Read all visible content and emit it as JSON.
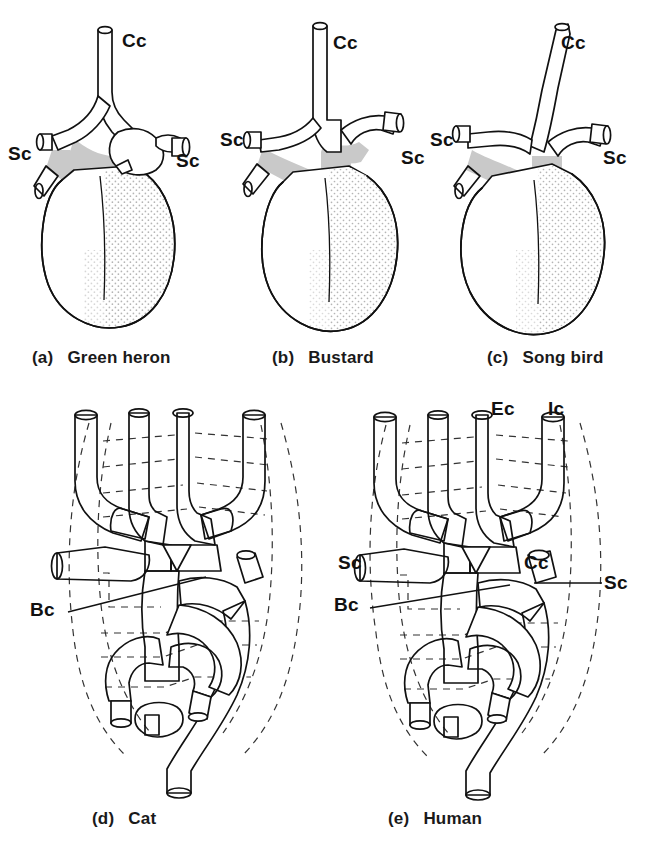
{
  "figure": {
    "background_color": "#ffffff",
    "ink_color": "#111111",
    "arch_shade_color": "#c9c9c9",
    "stipple_color": "#b9b9b9"
  },
  "panels": [
    {
      "id": "a",
      "caption_index": "(a)",
      "caption_name": "Green heron",
      "group": "birds",
      "labels": [
        {
          "text": "Cc",
          "name": "common-carotid-label",
          "x": 122,
          "y": 38
        },
        {
          "text": "Sc",
          "name": "subclavian-left-label",
          "x": 30,
          "y": 152
        },
        {
          "text": "Sc",
          "name": "subclavian-right-label",
          "x": 176,
          "y": 158
        }
      ]
    },
    {
      "id": "b",
      "caption_index": "(b)",
      "caption_name": "Bustard",
      "group": "birds",
      "labels": [
        {
          "text": "Cc",
          "name": "common-carotid-label",
          "x": 333,
          "y": 40
        },
        {
          "text": "Sc",
          "name": "subclavian-left-label",
          "x": 245,
          "y": 137
        },
        {
          "text": "Sc",
          "name": "subclavian-right-label",
          "x": 400,
          "y": 155
        }
      ]
    },
    {
      "id": "c",
      "caption_index": "(c)",
      "caption_name": "Song bird",
      "group": "birds",
      "labels": [
        {
          "text": "Cc",
          "name": "common-carotid-label",
          "x": 561,
          "y": 40
        },
        {
          "text": "Sc",
          "name": "subclavian-left-label",
          "x": 452,
          "y": 137
        },
        {
          "text": "Sc",
          "name": "subclavian-right-label",
          "x": 600,
          "y": 155
        }
      ]
    },
    {
      "id": "d",
      "caption_index": "(d)",
      "caption_name": "Cat",
      "group": "mammals",
      "labels": [
        {
          "text": "Bc",
          "name": "brachiocephalic-label",
          "x": 30,
          "y": 603
        }
      ]
    },
    {
      "id": "e",
      "caption_index": "(e)",
      "caption_name": "Human",
      "group": "mammals",
      "labels": [
        {
          "text": "Ec",
          "name": "external-carotid-label",
          "x": 491,
          "y": 400
        },
        {
          "text": "Ic",
          "name": "internal-carotid-label",
          "x": 547,
          "y": 400
        },
        {
          "text": "Sc",
          "name": "subclavian-left-label",
          "x": 340,
          "y": 555
        },
        {
          "text": "Cc",
          "name": "common-carotid-label",
          "x": 524,
          "y": 556
        },
        {
          "text": "Bc",
          "name": "brachiocephalic-label",
          "x": 336,
          "y": 596
        },
        {
          "text": "Sc",
          "name": "subclavian-right-label",
          "x": 605,
          "y": 578
        }
      ]
    }
  ],
  "captions": [
    {
      "index": "(a)",
      "name": "Green heron",
      "x": 32,
      "y": 351
    },
    {
      "index": "(b)",
      "name": "Bustard",
      "x": 272,
      "y": 351
    },
    {
      "index": "(c)",
      "name": "Song bird",
      "x": 487,
      "y": 351
    },
    {
      "index": "(d)",
      "name": "Cat",
      "x": 92,
      "y": 812
    },
    {
      "index": "(e)",
      "name": "Human",
      "x": 388,
      "y": 812
    }
  ],
  "abbreviations": {
    "Cc": "common carotid",
    "Sc": "subclavian",
    "Bc": "brachiocephalic",
    "Ec": "external carotid",
    "Ic": "internal carotid"
  },
  "patterns": {
    "fine_crosshatch_stipple": "outer / lateral vessel",
    "bold_round_dots": "inner carotid trunk",
    "dense_dark_dots": "arch junction segment",
    "horizontal_stripes": "brachiocephalic / ascending trunk",
    "vertical_hatch": "descending aorta",
    "solid_gray": "aortic arch (birds)",
    "light_stipple": "ventricular shading (birds)"
  }
}
